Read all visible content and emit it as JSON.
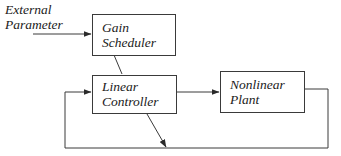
{
  "diagram": {
    "type": "block-diagram",
    "title": "",
    "input": {
      "label_line1": "External",
      "label_line2": "Parameter"
    },
    "blocks": [
      {
        "id": "gain-scheduler",
        "line1": "Gain",
        "line2": "Scheduler"
      },
      {
        "id": "linear-controller",
        "line1": "Linear",
        "line2": "Controller"
      },
      {
        "id": "nonlinear-plant",
        "line1": "Nonlinear",
        "line2": "Plant"
      }
    ],
    "edges": [
      {
        "from": "external-parameter",
        "to": "gain-scheduler",
        "arrow": true
      },
      {
        "from": "gain-scheduler",
        "to": "linear-controller",
        "arrow": false,
        "style": "diagonal"
      },
      {
        "from": "linear-controller",
        "to": "nonlinear-plant",
        "arrow": true
      },
      {
        "from": "nonlinear-plant",
        "to": "linear-controller",
        "arrow": true,
        "style": "feedback-loop"
      },
      {
        "from": "linear-controller",
        "to": "feedback-loop",
        "arrow": true,
        "style": "diagonal-adaptation"
      }
    ],
    "colors": {
      "line": "#3a3a3a",
      "text": "#1a1a1a",
      "background": "#ffffff"
    }
  }
}
